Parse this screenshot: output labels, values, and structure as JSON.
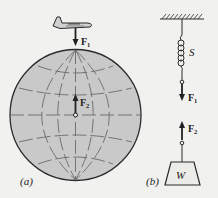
{
  "figure": {
    "panel_a": {
      "label": "(a)",
      "force_top": {
        "symbol": "F",
        "subscript": "1"
      },
      "force_center": {
        "symbol": "F",
        "subscript": "2"
      },
      "objects": [
        "airplane",
        "earth-globe"
      ]
    },
    "panel_b": {
      "label": "(b)",
      "spring_label": "S",
      "weight_label": "W",
      "force_top": {
        "symbol": "F",
        "subscript": "1"
      },
      "force_bottom": {
        "symbol": "F",
        "subscript": "2"
      },
      "objects": [
        "ceiling",
        "spring",
        "weight-block"
      ]
    }
  },
  "colors": {
    "background": "#f1f1ef",
    "globe_fill": "#c9c9c9",
    "ink": "#2a2a2a",
    "grid_line": "#6a6a6a"
  }
}
